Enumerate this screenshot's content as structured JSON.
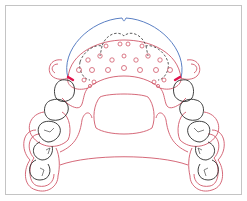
{
  "figure": {
    "type": "dental-appliance-diagram",
    "colors": {
      "frame": "#bdbdbd",
      "appliance_outline": "#d0586a",
      "labial_bow": "#5a7fc4",
      "teeth": "#2b2b2b",
      "dashed_outline": "#3a3a3a",
      "clasp_accent": "#e0104a",
      "perforation_holes": "#d0586a"
    },
    "labels": []
  }
}
